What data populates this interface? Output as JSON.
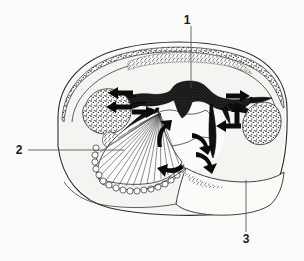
{
  "figure": {
    "type": "anatomical-cross-section-diagram",
    "title": "",
    "background_color": "#fbfbfa",
    "ink_color": "#111111",
    "line_color": "#2b2b2b",
    "width": 304,
    "height": 261
  },
  "labels": [
    {
      "id": "label-1",
      "text": "1",
      "x": 190,
      "y": 20,
      "leader": {
        "x1": 191,
        "y1": 26,
        "x2": 191,
        "y2": 88
      },
      "points_to": "central dark structure"
    },
    {
      "id": "label-2",
      "text": "2",
      "x": 19,
      "y": 154,
      "leader": {
        "x1": 28,
        "y1": 150,
        "x2": 124,
        "y2": 150
      },
      "points_to": "fan-shaped striated structure with beaded margin"
    },
    {
      "id": "label-3",
      "text": "3",
      "x": 245,
      "y": 241,
      "leader": {
        "x1": 246,
        "y1": 232,
        "x2": 246,
        "y2": 180
      },
      "points_to": "large lower-right pale region"
    }
  ],
  "regions": [
    {
      "id": "outer-body-outline",
      "name": "outer body outline",
      "shading": "none"
    },
    {
      "id": "dorsal-stippled-band",
      "name": "dorsal stippled band",
      "shading": "stipple"
    },
    {
      "id": "central-dark-mass",
      "name": "central dark mass",
      "shading": "solid-dark"
    },
    {
      "id": "left-stippled-oval",
      "name": "left stippled oval",
      "shading": "stipple"
    },
    {
      "id": "right-stippled-oval",
      "name": "right stippled oval",
      "shading": "stipple"
    },
    {
      "id": "fan-striated-structure",
      "name": "fan striated structure",
      "shading": "radiating-lines"
    },
    {
      "id": "beaded-chain-margin",
      "name": "beaded chain margin",
      "shading": "beads"
    },
    {
      "id": "central-pale-cavity",
      "name": "central pale cavity",
      "shading": "pale"
    },
    {
      "id": "lower-right-region",
      "name": "lower right region",
      "shading": "pale"
    }
  ],
  "arrows": [
    {
      "id": "arrow-left-upper",
      "direction": "left",
      "x": 118,
      "y": 93
    },
    {
      "id": "arrow-left-lower",
      "direction": "left",
      "x": 118,
      "y": 107
    },
    {
      "id": "arrow-left-inner",
      "direction": "right",
      "x": 140,
      "y": 110
    },
    {
      "id": "arrow-right-upper",
      "direction": "right",
      "x": 238,
      "y": 96
    },
    {
      "id": "arrow-right-mid",
      "direction": "up",
      "x": 238,
      "y": 113
    },
    {
      "id": "arrow-right-lower",
      "direction": "left",
      "x": 232,
      "y": 126
    },
    {
      "id": "arrow-curve-center-left",
      "direction": "curved-up",
      "x": 163,
      "y": 135
    },
    {
      "id": "arrow-curve-center-right",
      "direction": "curved-down",
      "x": 200,
      "y": 143
    },
    {
      "id": "arrow-curve-lower-right",
      "direction": "curved-down",
      "x": 204,
      "y": 160
    },
    {
      "id": "arrow-curve-lower-center",
      "direction": "curved-left",
      "x": 176,
      "y": 162
    }
  ]
}
